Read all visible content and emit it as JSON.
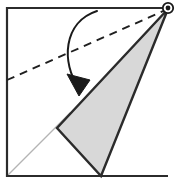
{
  "figure": {
    "canvas": {
      "width": 179,
      "height": 183,
      "background": "#ffffff"
    },
    "colors": {
      "stroke": "#2b2b2b",
      "shaded_fill": "#d8d8d8",
      "shaded_stroke": "#2b2b2b",
      "ghost_stroke": "#b4b4b4",
      "dashed_stroke": "#1f1f1f",
      "arrow_stroke": "#1a1a1a",
      "marker_fill": "#ffffff",
      "marker_stroke": "#1a1a1a"
    },
    "square_sheet": {
      "name": "paper-square-outline",
      "corners": [
        [
          7,
          8
        ],
        [
          168,
          8
        ],
        [
          168,
          176
        ],
        [
          7,
          176
        ]
      ],
      "drawn_edges": [
        "top",
        "left",
        "bottom"
      ],
      "open_edge": "right",
      "stroke_width": 2.2
    },
    "shaded_triangle": {
      "name": "folded-flap",
      "vertices": [
        [
          168,
          9
        ],
        [
          57,
          128
        ],
        [
          101,
          176
        ]
      ],
      "fill": "#d8d8d8",
      "stroke_width": 2.4
    },
    "ghost_crease": {
      "name": "ghost-diagonal",
      "from": [
        7,
        176
      ],
      "to": [
        70,
        113
      ],
      "stroke": "#b4b4b4",
      "stroke_width": 1.4
    },
    "dashed_fold_line": {
      "name": "fold-crease-dashed",
      "from": [
        7,
        80
      ],
      "to": [
        168,
        9
      ],
      "dash_pattern": "8 6",
      "stroke_width": 1.9
    },
    "fold_arrow": {
      "name": "fold-direction-arrow",
      "path_start": [
        97,
        11
      ],
      "control_1": [
        63,
        22
      ],
      "control_2": [
        61,
        63
      ],
      "path_end": [
        79,
        88
      ],
      "stroke_width": 2.0,
      "arrowhead": [
        [
          79,
          96
        ],
        [
          67,
          74
        ],
        [
          90,
          80
        ]
      ]
    },
    "corner_marker": {
      "name": "corner-point-marker",
      "center": [
        168,
        8
      ],
      "radius": 5.2,
      "inner_radius": 2.4,
      "stroke_width": 1.8
    },
    "labels": []
  }
}
